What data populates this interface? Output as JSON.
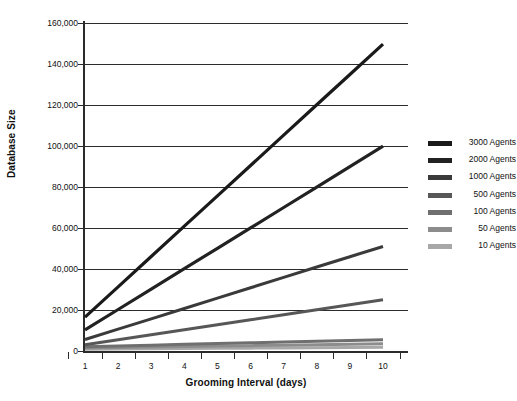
{
  "chart_data": {
    "type": "line",
    "title": "",
    "xlabel": "Grooming Interval (days)",
    "ylabel": "Database Size",
    "x": [
      1,
      2,
      3,
      4,
      5,
      6,
      7,
      8,
      9,
      10
    ],
    "x_tick_labels": [
      "1",
      "2",
      "3",
      "4",
      "5",
      "6",
      "7",
      "8",
      "9",
      "10"
    ],
    "y_tick_labels": [
      "0",
      "20,000",
      "40,000",
      "60,000",
      "80,000",
      "100,000",
      "120,000",
      "140,000",
      "160,000"
    ],
    "y_ticks": [
      0,
      20000,
      40000,
      60000,
      80000,
      100000,
      120000,
      140000,
      160000
    ],
    "ylim": [
      0,
      160000
    ],
    "xlim": [
      1,
      10
    ],
    "grid": "horizontal",
    "legend_position": "right",
    "series": [
      {
        "name": "3000 Agents",
        "color": "#1a1a1a",
        "width": 3.2,
        "values": [
          16500,
          31300,
          46100,
          60900,
          75700,
          90500,
          105300,
          120100,
          134900,
          149700
        ]
      },
      {
        "name": "2000 Agents",
        "color": "#222222",
        "width": 3.2,
        "values": [
          10300,
          20250,
          30200,
          40150,
          50100,
          60050,
          70000,
          79950,
          89900,
          99900
        ]
      },
      {
        "name": "1000 Agents",
        "color": "#3a3a3a",
        "width": 3.0,
        "values": [
          5600,
          10650,
          15700,
          20750,
          25800,
          30850,
          35900,
          40950,
          46000,
          51000
        ]
      },
      {
        "name": "500 Agents",
        "color": "#575757",
        "width": 3.0,
        "values": [
          3000,
          5450,
          7900,
          10350,
          12800,
          15250,
          17700,
          20150,
          22600,
          25000
        ]
      },
      {
        "name": "100 Agents",
        "color": "#6f6f6f",
        "width": 3.0,
        "values": [
          2100,
          2480,
          2860,
          3240,
          3620,
          4000,
          4380,
          4760,
          5140,
          5500
        ]
      },
      {
        "name": "50 Agents",
        "color": "#8c8c8c",
        "width": 3.0,
        "values": [
          1500,
          1720,
          1940,
          2160,
          2380,
          2600,
          2820,
          3040,
          3260,
          3500
        ]
      },
      {
        "name": "10 Agents",
        "color": "#a8a8a8",
        "width": 3.0,
        "values": [
          900,
          1000,
          1100,
          1200,
          1300,
          1400,
          1500,
          1600,
          1700,
          1800
        ]
      }
    ]
  },
  "legend": {
    "items": [
      {
        "label": "3000 Agents",
        "color": "#1a1a1a"
      },
      {
        "label": "2000 Agents",
        "color": "#222222"
      },
      {
        "label": "1000 Agents",
        "color": "#3a3a3a"
      },
      {
        "label": "500 Agents",
        "color": "#575757"
      },
      {
        "label": "100 Agents",
        "color": "#6f6f6f"
      },
      {
        "label": "50 Agents",
        "color": "#8c8c8c"
      },
      {
        "label": "10 Agents",
        "color": "#a8a8a8"
      }
    ]
  },
  "axes": {
    "y_title": "Database Size",
    "x_title": "Grooming Interval (days)"
  }
}
